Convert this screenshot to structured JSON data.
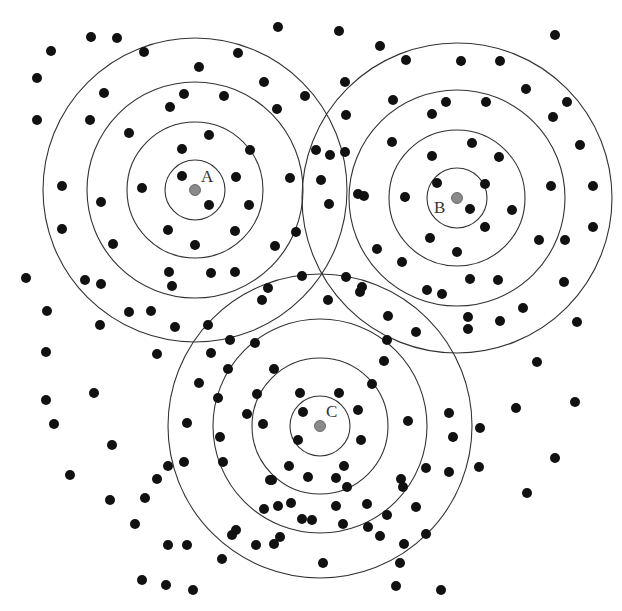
{
  "diagram": {
    "ring_color": "#333333",
    "dot_color": "#111111",
    "center_color": "#8a8a8a",
    "centers": [
      {
        "label": "A",
        "x": 195,
        "y": 190,
        "radii": [
          30,
          68,
          108,
          152
        ],
        "label_x": 201,
        "label_y": 182
      },
      {
        "label": "B",
        "x": 457,
        "y": 198,
        "radii": [
          30,
          68,
          108,
          155
        ],
        "label_x": 434,
        "label_y": 213
      },
      {
        "label": "C",
        "x": 320,
        "y": 426,
        "radii": [
          30,
          68,
          107,
          152
        ],
        "label_x": 326,
        "label_y": 417
      }
    ],
    "dots": [
      [
        278,
        27
      ],
      [
        51,
        51
      ],
      [
        91,
        37
      ],
      [
        117,
        38
      ],
      [
        144,
        52
      ],
      [
        199,
        67
      ],
      [
        238,
        53
      ],
      [
        339,
        31
      ],
      [
        380,
        46
      ],
      [
        555,
        35
      ],
      [
        37,
        78
      ],
      [
        104,
        93
      ],
      [
        184,
        94
      ],
      [
        224,
        96
      ],
      [
        264,
        82
      ],
      [
        305,
        96
      ],
      [
        345,
        82
      ],
      [
        37,
        120
      ],
      [
        90,
        120
      ],
      [
        129,
        133
      ],
      [
        170,
        107
      ],
      [
        209,
        135
      ],
      [
        250,
        150
      ],
      [
        277,
        109
      ],
      [
        316,
        150
      ],
      [
        346,
        115
      ],
      [
        406,
        60
      ],
      [
        461,
        61
      ],
      [
        500,
        61
      ],
      [
        526,
        89
      ],
      [
        567,
        102
      ],
      [
        553,
        117
      ],
      [
        580,
        145
      ],
      [
        446,
        102
      ],
      [
        486,
        102
      ],
      [
        393,
        100
      ],
      [
        432,
        114
      ],
      [
        392,
        142
      ],
      [
        472,
        143
      ],
      [
        432,
        156
      ],
      [
        499,
        157
      ],
      [
        485,
        184
      ],
      [
        551,
        186
      ],
      [
        593,
        186
      ],
      [
        437,
        183
      ],
      [
        345,
        152
      ],
      [
        321,
        180
      ],
      [
        330,
        155
      ],
      [
        329,
        204
      ],
      [
        358,
        194
      ],
      [
        364,
        196
      ],
      [
        405,
        197
      ],
      [
        470,
        209
      ],
      [
        512,
        210
      ],
      [
        593,
        227
      ],
      [
        485,
        227
      ],
      [
        430,
        238
      ],
      [
        457,
        252
      ],
      [
        539,
        240
      ],
      [
        565,
        240
      ],
      [
        377,
        249
      ],
      [
        402,
        262
      ],
      [
        470,
        279
      ],
      [
        498,
        280
      ],
      [
        564,
        282
      ],
      [
        442,
        294
      ],
      [
        427,
        290
      ],
      [
        360,
        292
      ],
      [
        362,
        287
      ],
      [
        328,
        300
      ],
      [
        388,
        316
      ],
      [
        416,
        332
      ],
      [
        468,
        317
      ],
      [
        500,
        321
      ],
      [
        523,
        308
      ],
      [
        468,
        329
      ],
      [
        577,
        322
      ],
      [
        537,
        362
      ],
      [
        575,
        402
      ],
      [
        555,
        458
      ],
      [
        516,
        408
      ],
      [
        527,
        493
      ],
      [
        62,
        186
      ],
      [
        101,
        202
      ],
      [
        142,
        188
      ],
      [
        182,
        176
      ],
      [
        182,
        149
      ],
      [
        236,
        177
      ],
      [
        249,
        205
      ],
      [
        209,
        205
      ],
      [
        168,
        230
      ],
      [
        195,
        245
      ],
      [
        235,
        231
      ],
      [
        275,
        246
      ],
      [
        296,
        232
      ],
      [
        290,
        178
      ],
      [
        62,
        229
      ],
      [
        113,
        244
      ],
      [
        26,
        278
      ],
      [
        101,
        284
      ],
      [
        169,
        272
      ],
      [
        172,
        286
      ],
      [
        211,
        273
      ],
      [
        235,
        272
      ],
      [
        268,
        288
      ],
      [
        262,
        300
      ],
      [
        302,
        276
      ],
      [
        346,
        277
      ],
      [
        47,
        311
      ],
      [
        85,
        280
      ],
      [
        46,
        352
      ],
      [
        100,
        325
      ],
      [
        129,
        312
      ],
      [
        151,
        311
      ],
      [
        175,
        327
      ],
      [
        208,
        325
      ],
      [
        230,
        340
      ],
      [
        255,
        343
      ],
      [
        157,
        354
      ],
      [
        211,
        353
      ],
      [
        274,
        369
      ],
      [
        228,
        369
      ],
      [
        46,
        400
      ],
      [
        94,
        393
      ],
      [
        257,
        394
      ],
      [
        247,
        414
      ],
      [
        54,
        424
      ],
      [
        112,
        445
      ],
      [
        187,
        423
      ],
      [
        157,
        479
      ],
      [
        184,
        462
      ],
      [
        199,
        383
      ],
      [
        218,
        398
      ],
      [
        220,
        437
      ],
      [
        263,
        424
      ],
      [
        223,
        462
      ],
      [
        300,
        393
      ],
      [
        303,
        412
      ],
      [
        298,
        440
      ],
      [
        289,
        466
      ],
      [
        270,
        480
      ],
      [
        308,
        477
      ],
      [
        339,
        393
      ],
      [
        358,
        410
      ],
      [
        361,
        440
      ],
      [
        344,
        466
      ],
      [
        336,
        478
      ],
      [
        347,
        487
      ],
      [
        291,
        503
      ],
      [
        312,
        520
      ],
      [
        336,
        506
      ],
      [
        302,
        519
      ],
      [
        387,
        340
      ],
      [
        372,
        384
      ],
      [
        384,
        361
      ],
      [
        408,
        421
      ],
      [
        449,
        413
      ],
      [
        453,
        437
      ],
      [
        449,
        472
      ],
      [
        426,
        468
      ],
      [
        401,
        479
      ],
      [
        403,
        487
      ],
      [
        416,
        507
      ],
      [
        426,
        534
      ],
      [
        404,
        544
      ],
      [
        380,
        536
      ],
      [
        396,
        586
      ],
      [
        441,
        590
      ],
      [
        367,
        504
      ],
      [
        232,
        535
      ],
      [
        222,
        559
      ],
      [
        166,
        585
      ],
      [
        145,
        498
      ],
      [
        135,
        524
      ],
      [
        168,
        545
      ],
      [
        142,
        580
      ],
      [
        187,
        545
      ],
      [
        193,
        590
      ],
      [
        274,
        544
      ],
      [
        323,
        563
      ],
      [
        400,
        563
      ],
      [
        280,
        537
      ],
      [
        256,
        545
      ],
      [
        278,
        506
      ],
      [
        272,
        480
      ],
      [
        236,
        530
      ],
      [
        264,
        509
      ],
      [
        343,
        524
      ],
      [
        368,
        527
      ],
      [
        387,
        515
      ],
      [
        480,
        428
      ],
      [
        479,
        467
      ],
      [
        70,
        475
      ],
      [
        110,
        500
      ],
      [
        168,
        466
      ]
    ]
  }
}
